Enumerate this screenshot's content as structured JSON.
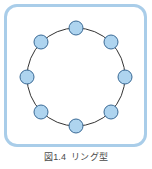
{
  "figure": {
    "caption_label": "図1.4",
    "caption_title": "リング型",
    "caption_full": "図1.4 リング型",
    "frame_border_color": "#a9cde9",
    "background_color": "#ffffff"
  },
  "chart_data": {
    "type": "diagram",
    "diagram_type": "ring-network-topology",
    "node_count": 8,
    "node_fill_color": "#aed4ef",
    "node_stroke_color": "#3a6a96",
    "edge_color": "#333333",
    "edge_width": 1,
    "node_radius": 7,
    "ring_center": {
      "x": 76,
      "y": 77
    },
    "ring_radius": 49,
    "nodes": [
      {
        "id": "n1",
        "label": "",
        "angle_deg": 90,
        "x": 76,
        "y": 28
      },
      {
        "id": "n2",
        "label": "",
        "angle_deg": 45,
        "x": 111,
        "y": 42
      },
      {
        "id": "n3",
        "label": "",
        "angle_deg": 0,
        "x": 125,
        "y": 77
      },
      {
        "id": "n4",
        "label": "",
        "angle_deg": 315,
        "x": 111,
        "y": 112
      },
      {
        "id": "n5",
        "label": "",
        "angle_deg": 270,
        "x": 76,
        "y": 126
      },
      {
        "id": "n6",
        "label": "",
        "angle_deg": 225,
        "x": 41,
        "y": 112
      },
      {
        "id": "n7",
        "label": "",
        "angle_deg": 180,
        "x": 27,
        "y": 77
      },
      {
        "id": "n8",
        "label": "",
        "angle_deg": 135,
        "x": 41,
        "y": 42
      }
    ],
    "edges": [
      {
        "from": "n1",
        "to": "n2"
      },
      {
        "from": "n2",
        "to": "n3"
      },
      {
        "from": "n3",
        "to": "n4"
      },
      {
        "from": "n4",
        "to": "n5"
      },
      {
        "from": "n5",
        "to": "n6"
      },
      {
        "from": "n6",
        "to": "n7"
      },
      {
        "from": "n7",
        "to": "n8"
      },
      {
        "from": "n8",
        "to": "n1"
      }
    ]
  }
}
